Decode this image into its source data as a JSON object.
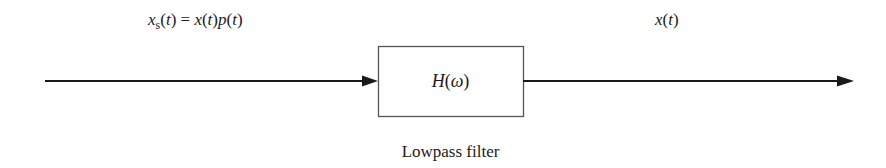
{
  "diagram": {
    "input_label": {
      "var": "x",
      "sub": "s",
      "rest_open": "(",
      "t1": "t",
      "eq": ") = ",
      "x2": "x",
      "p_open": "(",
      "t2": "t",
      "p_close": ")",
      "p": "p",
      "p2_open": "(",
      "t3": "t",
      "p2_close": ")"
    },
    "output_label": {
      "var": "x",
      "open": "(",
      "t": "t",
      "close": ")"
    },
    "block": {
      "name": "H",
      "open": "(",
      "arg": "ω",
      "close": ")"
    },
    "block_caption": "Lowpass filter",
    "colors": {
      "line": "#1a1a1a",
      "box_border": "#555555"
    }
  }
}
